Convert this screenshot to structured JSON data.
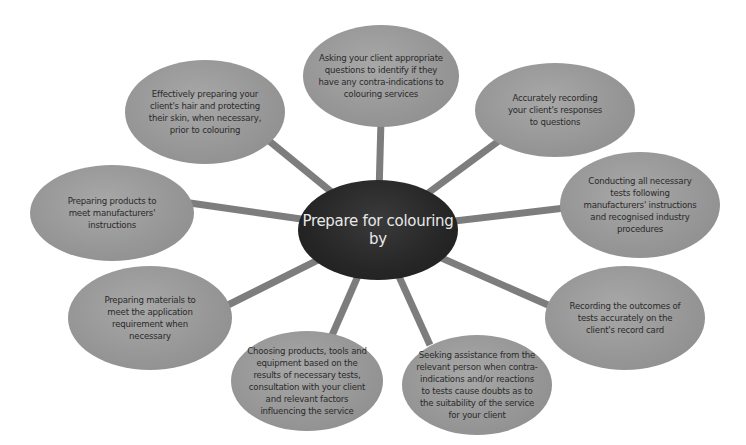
{
  "diagram": {
    "type": "spider-diagram",
    "center": {
      "label": "Prepare for colouring by",
      "line1": "Prepare for colouring",
      "line2": "by"
    },
    "colors": {
      "background": "#ffffff",
      "center_fill": "#262626",
      "center_text": "#e8e8e8",
      "node_fill": "#979797",
      "node_text": "#2a2a2a",
      "connector": "#7d7d7d"
    },
    "nodes": [
      {
        "id": "top",
        "label": "Asking your client appropriate questions to identify if they have any contra-indications to colouring services"
      },
      {
        "id": "top-right",
        "label": "Accurately recording your client's responses to questions"
      },
      {
        "id": "right",
        "label": "Conducting all necessary tests following manufacturers' instructions and recognised industry procedures"
      },
      {
        "id": "bottom-right",
        "label": "Recording the outcomes of tests accurately on the client's record card"
      },
      {
        "id": "bottom-center-right",
        "label": "Seeking assistance from the relevant person when contra-indications and/or reactions to tests cause doubts as to the suitability of the service for your client"
      },
      {
        "id": "bottom-center-left",
        "label": "Choosing products, tools and equipment based on the results of necessary tests, consultation with your client and relevant factors influencing the service"
      },
      {
        "id": "bottom-left",
        "label": "Preparing materials to meet the application requirement when necessary"
      },
      {
        "id": "left",
        "label": "Preparing products to meet manufacturers' instructions"
      },
      {
        "id": "top-left",
        "label": "Effectively preparing your client's hair and protecting their skin, when necessary, prior to colouring"
      }
    ]
  }
}
